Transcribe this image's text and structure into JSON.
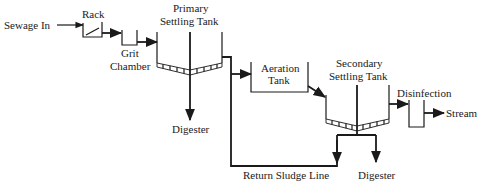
{
  "diagram": {
    "type": "wastewater-treatment-process-flow",
    "nodes": {
      "sewage_in": "Sewage In",
      "rack": "Rack",
      "grit_chamber_line1": "Grit",
      "grit_chamber_line2": "Chamber",
      "primary_tank_line1": "Primary",
      "primary_tank_line2": "Settling Tank",
      "primary_digester": "Digester",
      "aeration_tank_line1": "Aeration",
      "aeration_tank_line2": "Tank",
      "secondary_tank_line1": "Secondary",
      "secondary_tank_line2": "Settling Tank",
      "disinfection": "Disinfection",
      "stream": "Stream",
      "return_sludge_line": "Return Sludge Line",
      "secondary_digester": "Digester"
    },
    "edges": [
      {
        "from": "Sewage In",
        "to": "Rack"
      },
      {
        "from": "Rack",
        "to": "Grit Chamber"
      },
      {
        "from": "Grit Chamber",
        "to": "Primary Settling Tank"
      },
      {
        "from": "Primary Settling Tank",
        "to": "Digester"
      },
      {
        "from": "Primary Settling Tank",
        "to": "Aeration Tank"
      },
      {
        "from": "Aeration Tank",
        "to": "Secondary Settling Tank"
      },
      {
        "from": "Secondary Settling Tank",
        "to": "Disinfection"
      },
      {
        "from": "Disinfection",
        "to": "Stream"
      },
      {
        "from": "Secondary Settling Tank",
        "to": "Return Sludge Line"
      },
      {
        "from": "Secondary Settling Tank",
        "to": "Digester"
      },
      {
        "from": "Return Sludge Line",
        "to": "Aeration Tank"
      }
    ],
    "colors": {
      "line": "#1a1a1a",
      "background": "#ffffff"
    }
  }
}
